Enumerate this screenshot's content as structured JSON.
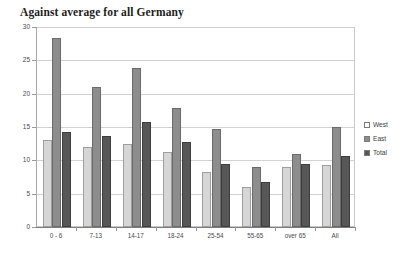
{
  "chart_data": {
    "type": "bar",
    "title": "Against average for all Germany",
    "xlabel": "",
    "ylabel": "",
    "ylim": [
      0,
      30
    ],
    "yticks": [
      0,
      5,
      10,
      15,
      20,
      25,
      30
    ],
    "grid": true,
    "legend_position": "right",
    "categories": [
      "0 - 6",
      "7-13",
      "14-17",
      "18-24",
      "25-54",
      "55-65",
      "over 65",
      "All"
    ],
    "series": [
      {
        "name": "West",
        "color": "#d6d6d6",
        "values": [
          13.0,
          12.0,
          12.5,
          11.2,
          8.2,
          6.0,
          9.0,
          9.3
        ]
      },
      {
        "name": "East",
        "color": "#8d8d8d",
        "values": [
          28.3,
          21.0,
          23.8,
          17.9,
          14.7,
          9.0,
          11.0,
          15.0
        ]
      },
      {
        "name": "Total",
        "color": "#575757",
        "values": [
          14.3,
          13.7,
          15.7,
          12.7,
          9.4,
          6.8,
          9.4,
          10.7
        ]
      }
    ]
  }
}
